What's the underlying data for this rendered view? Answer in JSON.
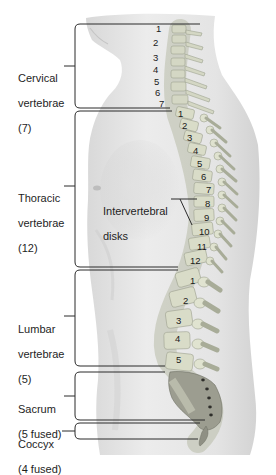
{
  "diagram": {
    "type": "anatomy-lateral-spine",
    "regions": [
      {
        "id": "cervical",
        "name": "Cervical",
        "line2": "vertebrae",
        "count_label": "(7)",
        "count": 7,
        "numbers": [
          "1",
          "2",
          "3",
          "4",
          "5",
          "6",
          "7"
        ]
      },
      {
        "id": "thoracic",
        "name": "Thoracic",
        "line2": "vertebrae",
        "count_label": "(12)",
        "count": 12,
        "numbers": [
          "1",
          "2",
          "3",
          "4",
          "5",
          "6",
          "7",
          "8",
          "9",
          "10",
          "11",
          "12"
        ]
      },
      {
        "id": "lumbar",
        "name": "Lumbar",
        "line2": "vertebrae",
        "count_label": "(5)",
        "count": 5,
        "numbers": [
          "1",
          "2",
          "3",
          "4",
          "5"
        ]
      },
      {
        "id": "sacrum",
        "name": "Sacrum",
        "line2": "(5 fused)",
        "count": 5
      },
      {
        "id": "coccyx",
        "name": "Coccyx",
        "line2": "(4 fused)",
        "count": 4
      }
    ],
    "callout": {
      "line1": "Intervertebral",
      "line2": "disks"
    },
    "colors": {
      "body": "#e6e6e6",
      "body_shadow": "#cfcfcf",
      "bone": "#d9dcc8",
      "bone_dark": "#a9ad98",
      "disk": "#c9ceb5",
      "sacrum": "#9a9a8e",
      "bracket": "#2a2a2a"
    }
  }
}
